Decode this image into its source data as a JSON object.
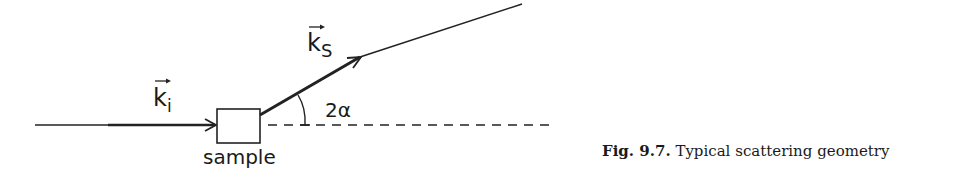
{
  "figure": {
    "labels": {
      "incident_wavevector": "k",
      "incident_subscript": "i",
      "scattered_wavevector": "k",
      "scattered_subscript": "S",
      "angle": "2α",
      "sample": "sample"
    },
    "caption": {
      "number": "Fig. 9.7.",
      "text": "Typical scattering geometry"
    }
  }
}
